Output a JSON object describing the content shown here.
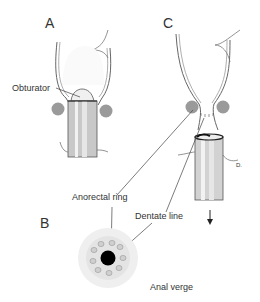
{
  "panels": {
    "a": {
      "letter": "A"
    },
    "b": {
      "letter": "B"
    },
    "c": {
      "letter": "C"
    }
  },
  "labels": {
    "obturator": "Obturator",
    "anorectal_ring": "Anorectal ring",
    "dentate_line": "Dentate line",
    "anal_verge": "Anal verge",
    "signature": "D."
  },
  "colors": {
    "line": "#555555",
    "tube": "#c8c8c8",
    "tube_light": "#ececec",
    "sphincter": "#9a9a9a",
    "lumen": "#000000"
  }
}
